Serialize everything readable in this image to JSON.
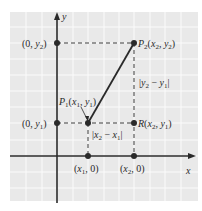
{
  "diagram": {
    "colors": {
      "background": "#ffffff",
      "grid_fill": "#e9e9e9",
      "grid_line": "#fbfbfb",
      "ink": "#2a2a2a"
    },
    "axes": {
      "x_label": "x",
      "y_label": "y"
    },
    "points": [
      {
        "id": "P1",
        "label": "P1(x1, y1)"
      },
      {
        "id": "P2",
        "label": "P2(x2, y2)"
      },
      {
        "id": "R",
        "label": "R(x2, y1)"
      },
      {
        "id": "y2-axis",
        "label": "(0, y2)"
      },
      {
        "id": "y1-axis",
        "label": "(0, y1)"
      },
      {
        "id": "x1-axis",
        "label": "(x1, 0)"
      },
      {
        "id": "x2-axis",
        "label": "(x2, 0)"
      }
    ],
    "measures": {
      "vertical": "|y2 − y1|",
      "horizontal": "|x2 − x1|"
    }
  }
}
